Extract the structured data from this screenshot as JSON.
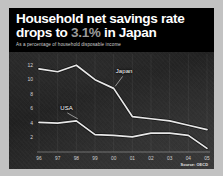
{
  "card": {
    "background_color": "#000000",
    "frame_color": "#c2c2c2"
  },
  "header": {
    "title_part1": "Household net savings rate",
    "title_part2": "drops to ",
    "title_highlight": "3.1%",
    "title_part3": " in Japan",
    "title_full": "Household net savings rate drops to 3.1% in Japan",
    "subtitle": "As a percentage of household disposable income",
    "title_color": "#ffffff",
    "highlight_color": "#9a9a9a",
    "subtitle_color": "#cfcfcf"
  },
  "footer": {
    "source": "Source: OECD"
  },
  "chart_data": {
    "type": "line",
    "subtitle": "As a percentage of household disposable income",
    "xlabel": "",
    "ylabel": "",
    "categories": [
      "96",
      "97",
      "98",
      "99",
      "00",
      "01",
      "02",
      "03",
      "04",
      "05"
    ],
    "x_tick_labels": [
      "96",
      "97",
      "98",
      "99",
      "00",
      "01",
      "02",
      "03",
      "04",
      "05"
    ],
    "y_tick_labels": [
      "12",
      "10",
      "8",
      "6",
      "4",
      "2"
    ],
    "y_ticks": [
      12,
      10,
      8,
      6,
      4,
      2
    ],
    "ylim": [
      0,
      13
    ],
    "xlim": [
      0,
      9
    ],
    "grid": "vertical-only",
    "legend": "inline-labels",
    "line_color": "#e8e8e8",
    "series": [
      {
        "name": "Japan",
        "label": "Japan",
        "values": [
          11.5,
          11.1,
          12.0,
          10.0,
          8.8,
          4.9,
          4.6,
          4.3,
          3.7,
          3.1
        ]
      },
      {
        "name": "USA",
        "label": "USA",
        "values": [
          4.1,
          4.0,
          4.3,
          2.4,
          2.3,
          2.1,
          2.6,
          2.6,
          2.3,
          0.5
        ]
      }
    ],
    "annotations": [
      {
        "text": "Japan",
        "series": "Japan",
        "anchor_index": 4
      },
      {
        "text": "USA",
        "series": "USA",
        "anchor_index": 2
      }
    ]
  }
}
